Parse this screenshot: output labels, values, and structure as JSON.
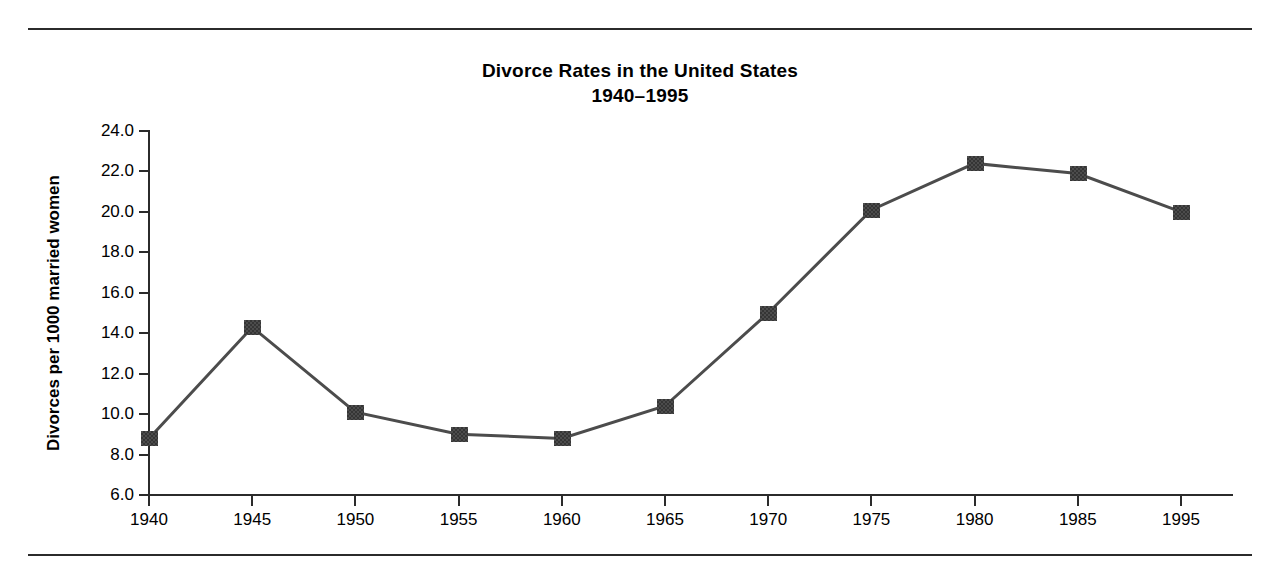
{
  "chart_data": {
    "type": "line",
    "title": "Divorce Rates in the United States",
    "subtitle": "1940–1995",
    "xlabel": "",
    "ylabel": "Divorces per 1000 married women",
    "categories": [
      "1940",
      "1945",
      "1950",
      "1955",
      "1960",
      "1965",
      "1970",
      "1975",
      "1980",
      "1985",
      "1995"
    ],
    "values": [
      8.8,
      14.3,
      10.1,
      9.0,
      8.8,
      10.4,
      15.0,
      20.1,
      22.4,
      21.9,
      20.0
    ],
    "series": [
      {
        "name": "Divorces per 1000 married women",
        "values": [
          8.8,
          14.3,
          10.1,
          9.0,
          8.8,
          10.4,
          15.0,
          20.1,
          22.4,
          21.9,
          20.0
        ]
      }
    ],
    "ylim": [
      6.0,
      24.0
    ],
    "ytick_labels": [
      "24.0",
      "22.0",
      "20.0",
      "18.0",
      "16.0",
      "14.0",
      "12.0",
      "10.0",
      "8.0",
      "6.0"
    ],
    "ytick_values": [
      24.0,
      22.0,
      20.0,
      18.0,
      16.0,
      14.0,
      12.0,
      10.0,
      8.0,
      6.0
    ],
    "xtick_labels": [
      "1940",
      "1945",
      "1950",
      "1955",
      "1960",
      "1965",
      "1970",
      "1975",
      "1980",
      "1985",
      "1995"
    ],
    "grid": false,
    "legend": "none",
    "marker": "filled-square",
    "line_color": "#4c4c4c",
    "marker_color": "#4c4c4c",
    "axis_color": "#2b2b2b",
    "background_color": "#ffffff"
  }
}
